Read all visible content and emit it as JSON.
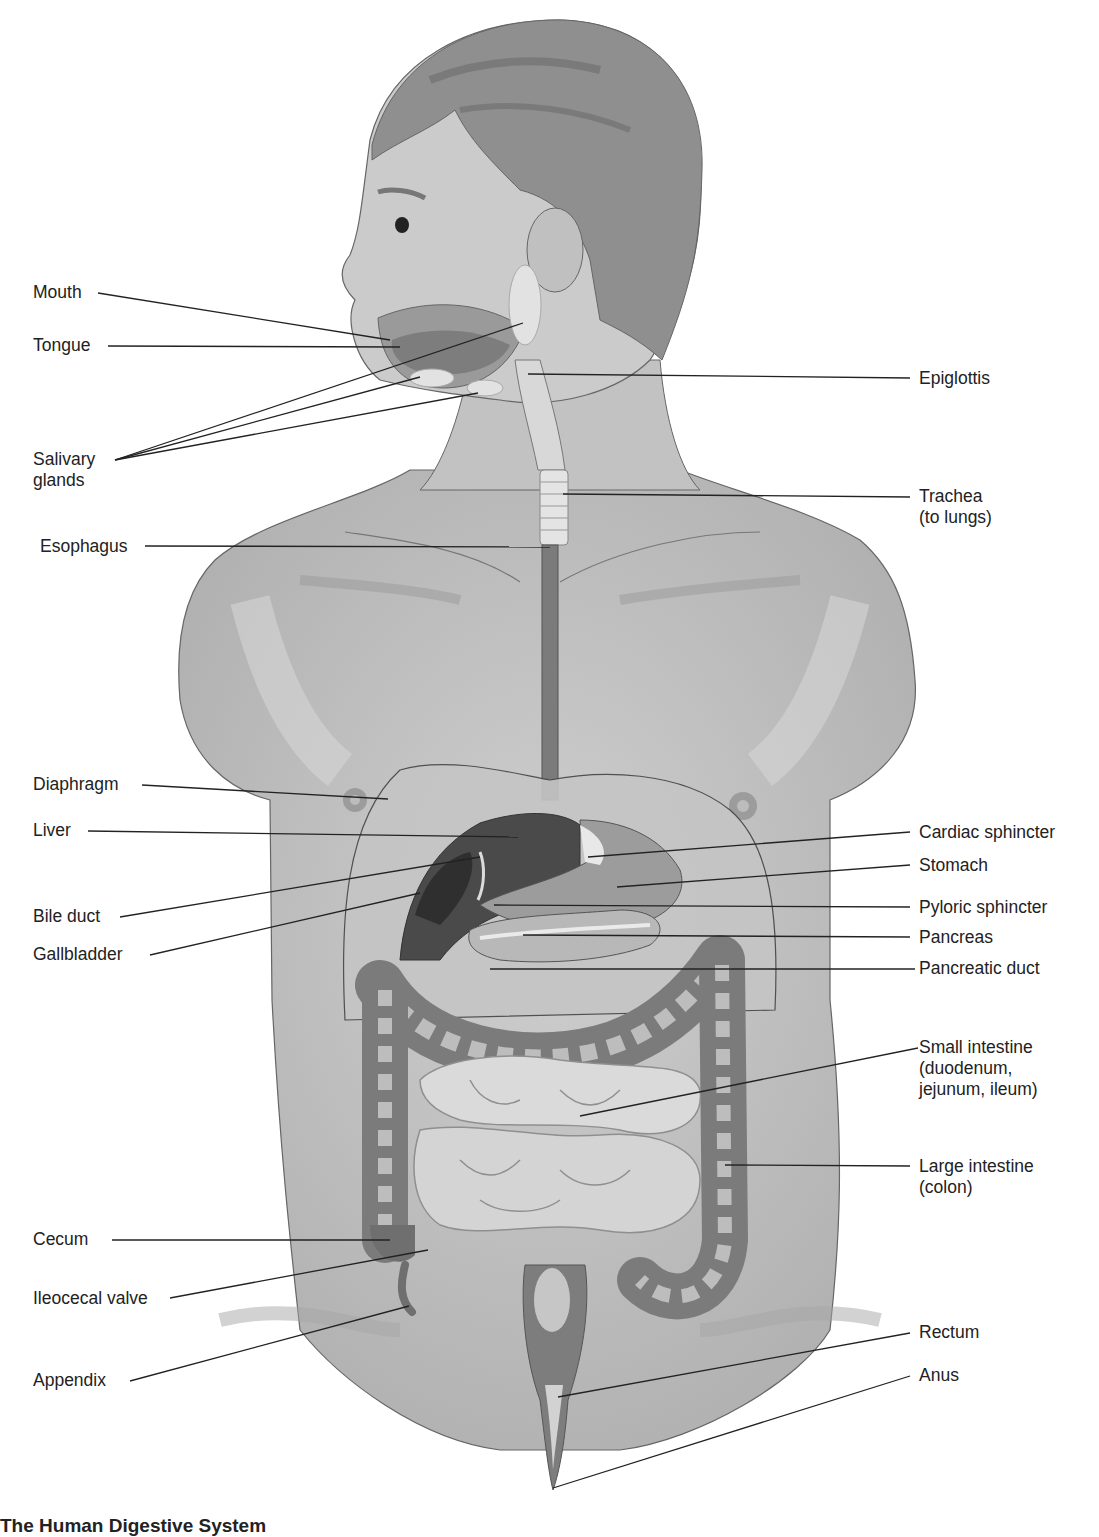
{
  "figure": {
    "title": "The Human Digestive System",
    "caption_visible": "The Human Digestive System",
    "colors": {
      "background": "#ffffff",
      "body_fill": "#b9b9b9",
      "skin_light": "#cfcfcf",
      "hair": "#8d8d8d",
      "organ_dark": "#4a4a4a",
      "organ_mid": "#8a8a8a",
      "organ_light": "#dcdcdc",
      "leader_line": "#222222"
    }
  },
  "labels": {
    "left": [
      {
        "id": "mouth",
        "text": "Mouth",
        "x": 33,
        "y": 282,
        "target": [
          390,
          340
        ]
      },
      {
        "id": "tongue",
        "text": "Tongue",
        "x": 33,
        "y": 335,
        "target": [
          400,
          347
        ]
      },
      {
        "id": "salivary",
        "text": "Salivary",
        "text2": "glands",
        "x": 33,
        "y": 452,
        "targets": [
          [
            523,
            323
          ],
          [
            420,
            377
          ],
          [
            478,
            393
          ]
        ]
      },
      {
        "id": "esophagus",
        "text": "Esophagus",
        "x": 40,
        "y": 536,
        "target": [
          550,
          547
        ]
      },
      {
        "id": "diaphragm",
        "text": "Diaphragm",
        "x": 33,
        "y": 773,
        "target": [
          388,
          799
        ]
      },
      {
        "id": "liver",
        "text": "Liver",
        "x": 33,
        "y": 820,
        "target": [
          518,
          837
        ]
      },
      {
        "id": "bile_duct",
        "text": "Bile duct",
        "x": 33,
        "y": 908,
        "target": [
          480,
          857
        ]
      },
      {
        "id": "gallbladder",
        "text": "Gallbladder",
        "x": 33,
        "y": 946,
        "target": [
          420,
          893
        ]
      },
      {
        "id": "cecum",
        "text": "Cecum",
        "x": 33,
        "y": 1230,
        "target": [
          390,
          1240
        ]
      },
      {
        "id": "ileocecal_valve",
        "text": "Ileocecal valve",
        "x": 33,
        "y": 1289,
        "target": [
          428,
          1250
        ]
      },
      {
        "id": "appendix",
        "text": "Appendix",
        "x": 33,
        "y": 1372,
        "target": [
          409,
          1306
        ]
      }
    ],
    "right": [
      {
        "id": "epiglottis",
        "text": "Epiglottis",
        "x": 919,
        "y": 368,
        "target": [
          528,
          374
        ]
      },
      {
        "id": "trachea",
        "text": "Trachea",
        "text2": "(to lungs)",
        "x": 919,
        "y": 486,
        "target": [
          563,
          494
        ]
      },
      {
        "id": "cardiac_sphincter",
        "text": "Cardiac sphincter",
        "x": 919,
        "y": 822,
        "target": [
          588,
          857
        ]
      },
      {
        "id": "stomach",
        "text": "Stomach",
        "x": 919,
        "y": 855,
        "target": [
          617,
          887
        ]
      },
      {
        "id": "pyloric_sphincter",
        "text": "Pyloric sphincter",
        "x": 919,
        "y": 897,
        "target": [
          494,
          905
        ]
      },
      {
        "id": "pancreas",
        "text": "Pancreas",
        "x": 919,
        "y": 930,
        "target": [
          523,
          935
        ]
      },
      {
        "id": "pancreatic_duct",
        "text": "Pancreatic duct",
        "x": 919,
        "y": 960,
        "target": [
          490,
          969
        ]
      },
      {
        "id": "small_intestine",
        "text": "Small intestine",
        "text2": "(duodenum,",
        "text3": "jejunum, ileum)",
        "x": 919,
        "y": 1038,
        "target": [
          580,
          1116
        ]
      },
      {
        "id": "large_intestine",
        "text": "Large intestine",
        "text2": "(colon)",
        "x": 919,
        "y": 1157,
        "target": [
          725,
          1165
        ]
      },
      {
        "id": "rectum",
        "text": "Rectum",
        "x": 919,
        "y": 1323,
        "target": [
          558,
          1397
        ]
      },
      {
        "id": "anus",
        "text": "Anus",
        "x": 919,
        "y": 1366,
        "target": [
          553,
          1488
        ]
      }
    ]
  }
}
